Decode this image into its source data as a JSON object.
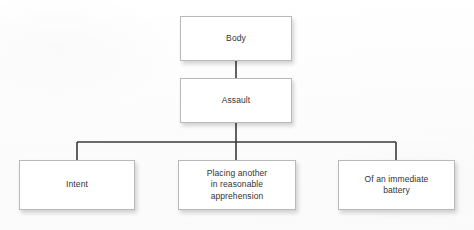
{
  "diagram": {
    "type": "hierarchy-tree",
    "title": "",
    "background_color": "#fdfdfd",
    "box_fill_color": "#ffffff",
    "box_border_color": "#b9b9b9",
    "connector_color": "#3a3a3a",
    "text_color": "#333333",
    "nodes": [
      {
        "id": "body",
        "label": "Body",
        "level": 0
      },
      {
        "id": "assault",
        "label": "Assault",
        "level": 1
      },
      {
        "id": "intent",
        "label": "Intent",
        "level": 2
      },
      {
        "id": "placing",
        "label": "Placing another\nin reasonable\napprehension",
        "level": 2
      },
      {
        "id": "battery",
        "label": "Of an immediate\nbattery",
        "level": 2
      }
    ],
    "edges": [
      {
        "from": "body",
        "to": "assault"
      },
      {
        "from": "assault",
        "to": "intent"
      },
      {
        "from": "assault",
        "to": "placing"
      },
      {
        "from": "assault",
        "to": "battery"
      }
    ]
  }
}
